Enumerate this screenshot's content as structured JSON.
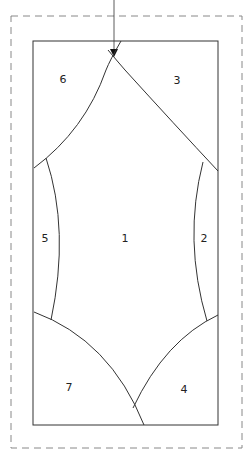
{
  "diagram": {
    "type": "foundation paper piecing pattern",
    "pieces": [
      {
        "id": "piece-1",
        "label": "1",
        "x": 125,
        "y": 238
      },
      {
        "id": "piece-2",
        "label": "2",
        "x": 204,
        "y": 238
      },
      {
        "id": "piece-3",
        "label": "3",
        "x": 177,
        "y": 80
      },
      {
        "id": "piece-4",
        "label": "4",
        "x": 184,
        "y": 389
      },
      {
        "id": "piece-5",
        "label": "5",
        "x": 45,
        "y": 238
      },
      {
        "id": "piece-6",
        "label": "6",
        "x": 63,
        "y": 79
      },
      {
        "id": "piece-7",
        "label": "7",
        "x": 69,
        "y": 387
      }
    ],
    "colors": {
      "line": "#333333",
      "dashed": "#888888",
      "background": "#ffffff"
    }
  }
}
